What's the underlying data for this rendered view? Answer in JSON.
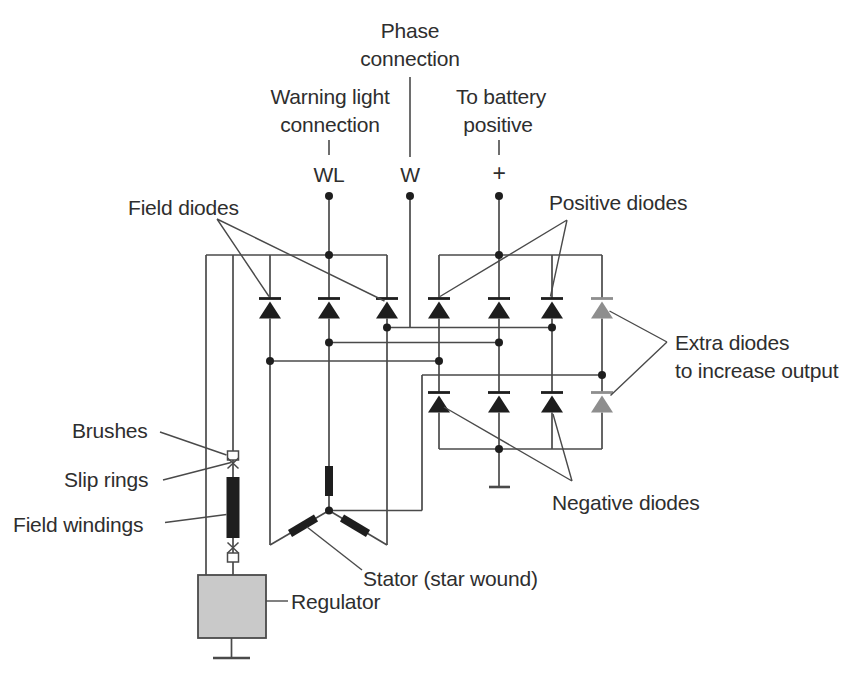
{
  "top_terminals": {
    "phase": {
      "line1": "Phase",
      "line2": "connection"
    },
    "warning": {
      "line1": "Warning light",
      "line2": "connection"
    },
    "battery": {
      "line1": "To battery",
      "line2": "positive"
    },
    "wl": "WL",
    "w": "W",
    "plus": "+"
  },
  "annotations": {
    "field_diodes": "Field diodes",
    "positive_diodes": "Positive diodes",
    "extra_diodes": {
      "line1": "Extra diodes",
      "line2": "to increase output"
    },
    "negative_diodes": "Negative diodes",
    "brushes": "Brushes",
    "slip_rings": "Slip rings",
    "field_windings": "Field windings",
    "regulator": "Regulator",
    "stator": "Stator (star wound)"
  },
  "colors": {
    "background": "#ffffff",
    "line": "#4a4a4a",
    "text": "#2e2e2e",
    "diode": "#1e1e1e",
    "extra_diode": "#8e8e8e",
    "regulator_fill": "#c9c9c9",
    "regulator_border": "#4a4a4a"
  }
}
